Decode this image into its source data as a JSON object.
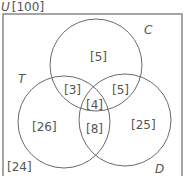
{
  "universe": {
    "symbol": "U",
    "total": "[100]"
  },
  "sets": [
    {
      "id": "C",
      "label": "C"
    },
    {
      "id": "T",
      "label": "T"
    },
    {
      "id": "D",
      "label": "D"
    }
  ],
  "regions": {
    "C_only": "[5]",
    "T_only": "[26]",
    "D_only": "[25]",
    "T_and_C_only": "[3]",
    "C_and_D_only": "[5]",
    "T_and_D_only": "[8]",
    "all_three": "[4]",
    "outside": "[24]"
  },
  "colors": {
    "stroke": "#6a6a6a",
    "text": "#555555"
  }
}
